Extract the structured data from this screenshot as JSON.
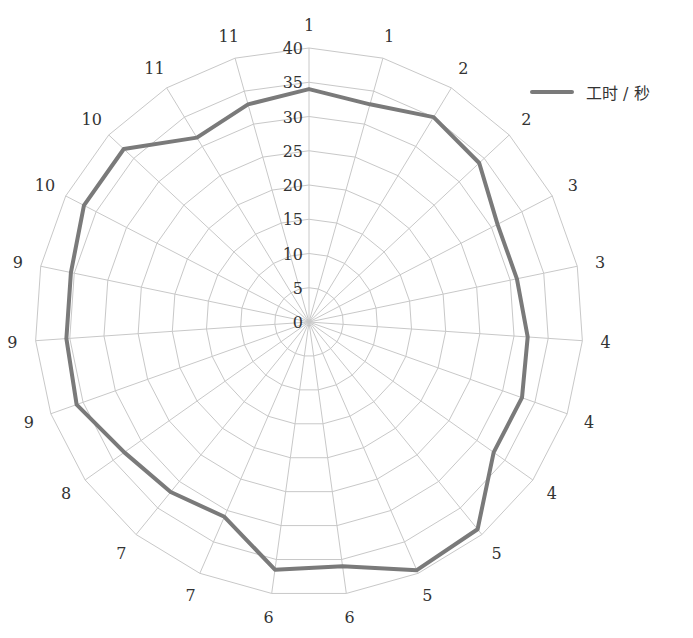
{
  "chart_data": {
    "type": "radar",
    "title": "",
    "categories": [
      "1",
      "1",
      "2",
      "2",
      "3",
      "3",
      "4",
      "4",
      "4",
      "5",
      "5",
      "6",
      "6",
      "7",
      "7",
      "8",
      "9",
      "9",
      "9",
      "10",
      "10",
      "11",
      "11"
    ],
    "series": [
      {
        "name": "工时 / 秒",
        "values": [
          34,
          33,
          35,
          34,
          31,
          31,
          32,
          33,
          33,
          39,
          39.5,
          36,
          36.5,
          31,
          32,
          33,
          36,
          35.5,
          35.5,
          37,
          37,
          31.5,
          33
        ]
      }
    ],
    "rticks": [
      0,
      5,
      10,
      15,
      20,
      25,
      30,
      35,
      40
    ],
    "rlim": [
      0,
      40
    ],
    "grid": true,
    "legend_position": "top-right",
    "line_color": "#7a7a7a",
    "grid_color": "#c8c8c8"
  },
  "legend": {
    "label": "工时 / 秒"
  }
}
